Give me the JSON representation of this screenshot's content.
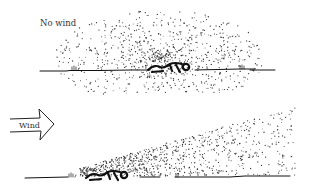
{
  "panels": [
    {
      "id": "no-wind",
      "label": "No wind",
      "scenario": "Scent cloud spreads evenly around a person lying on the ground",
      "ground_y": 70,
      "person_x": 160,
      "cloud": {
        "shape": "ellipse",
        "cx": 160,
        "cy": 58,
        "rx": 105,
        "ry": 48,
        "dots": 900
      }
    },
    {
      "id": "wind",
      "label": "Wind",
      "scenario": "Wind blows scent cloud downwind, rising in a plume to the right",
      "ground_y": 80,
      "person_x": 110,
      "arrow": {
        "x": 8,
        "y": 12,
        "w": 48,
        "h": 30
      },
      "cloud": {
        "shape": "plume",
        "x0": 80,
        "x1": 295,
        "dots": 850
      }
    }
  ],
  "colors": {
    "ink": "#111111",
    "dots": "#333333",
    "text": "#333333",
    "background": "#ffffff"
  }
}
